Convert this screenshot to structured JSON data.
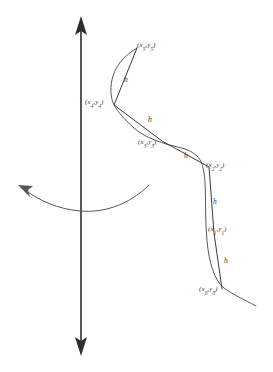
{
  "figure": {
    "background_color": "#ffffff",
    "line_color": "#3a3a3c",
    "curve_color": "#58585a",
    "axis_color": "#2e2e30",
    "width": 273,
    "height": 372
  },
  "axes": {
    "vertical_axis_label": "vertical-axis",
    "horizontal_axis_label": "curved-horizontal-axis",
    "vertical_axis_x": 81,
    "vertical_axis_top_y": 18,
    "vertical_axis_bottom_y": 354,
    "arrow_up": "up-arrowhead",
    "arrow_down": "down-arrowhead",
    "arrow_curve": "curved-arrowhead"
  },
  "points": [
    {
      "id": "p0",
      "label": "(x",
      "sub1": "0",
      "mid": ",y",
      "sub2": "0",
      "tail": ")",
      "x": 222,
      "y": 289,
      "label_x": 199,
      "label_y": 286
    },
    {
      "id": "p1",
      "label": "(x",
      "sub1": "1",
      "mid": ",y",
      "sub2": "1",
      "tail": ")",
      "x": 214,
      "y": 233,
      "label_x": 208,
      "label_y": 226
    },
    {
      "id": "p2",
      "label": "(x",
      "sub1": "2",
      "mid": ",y",
      "sub2": "2",
      "tail": ")",
      "x": 209,
      "y": 167,
      "label_x": 206,
      "label_y": 162
    },
    {
      "id": "p3",
      "label": "(x",
      "sub1": "3",
      "mid": ",y",
      "sub2": "3",
      "tail": ")",
      "x": 162,
      "y": 141,
      "label_x": 138,
      "label_y": 139
    },
    {
      "id": "p4",
      "label": "(x",
      "sub1": "4",
      "mid": ",y",
      "sub2": "4",
      "tail": ")",
      "x": 114,
      "y": 105,
      "label_x": 85,
      "label_y": 99
    },
    {
      "id": "p5",
      "label": "(x",
      "sub1": "5",
      "mid": ",y",
      "sub2": "5",
      "tail": ")",
      "x": 137,
      "y": 48,
      "label_x": 137,
      "label_y": 42
    }
  ],
  "step_labels": [
    {
      "id": "h0",
      "text": "h",
      "x": 224,
      "y": 257
    },
    {
      "id": "h1",
      "text": "h",
      "x": 213,
      "y": 198
    },
    {
      "id": "h2",
      "text": "h",
      "x": 184,
      "y": 152
    },
    {
      "id": "h3",
      "text": "h",
      "x": 148,
      "y": 116
    },
    {
      "id": "h4",
      "text": "h",
      "x": 124,
      "y": 76
    }
  ],
  "geometry": {
    "polyline": "M 222 289 L 214 233 L 209 167 L 162 141 L 114 105 L 137 48",
    "solution_curve": "M 256 306 C 243 299 232 294 224 288 C 214 280 209 262 207 241 C 205 222 206 200 205 182 C 204 169 202 160 196 155 C 188 148 176 147 166 144 C 154 140 143 136 134 128 C 124 119 118 112 114 105 C 110 97 110 86 113 76 C 117 63 127 54 137 48",
    "horizontal_curve": "M 149 185 C 128 206 102 213 80 211 C 58 209 40 201 25 190",
    "h_axis_arrow": "M 25 190 L 36 189 L 29 197 Z"
  }
}
